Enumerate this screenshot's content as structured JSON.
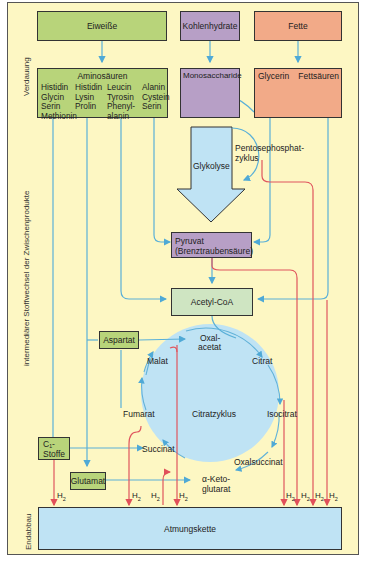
{
  "side_labels": {
    "digestion": "Verdauung",
    "intermediate": "intermediärer Stoffwechsel der Zwischenprodukte",
    "final": "Endabbau"
  },
  "sources": {
    "proteins": "Eiweiße",
    "carbohydrates": "Kohlenhydrate",
    "fats": "Fette"
  },
  "products": {
    "amino_acids_title": "Aminosäuren",
    "amino_acids": [
      [
        "Histidin",
        "Histidin",
        "Leucin",
        "Alanin"
      ],
      [
        "Glycin",
        "Lysin",
        "Tyrosin",
        "Cystein"
      ],
      [
        "Serin",
        "Prolin",
        "Phenyl-",
        "Serin"
      ],
      [
        "Methionin",
        "",
        "alanin",
        ""
      ]
    ],
    "monosaccharides": "Monosaccharide",
    "glycerin": "Glycerin",
    "fatty_acids": "Fettsäuren"
  },
  "pathways": {
    "glycolysis": "Glykolyse",
    "pentose_line1": "Pentosephosphat-",
    "pentose_line2": "zyklus",
    "pyruvate_line1": "Pyruvat",
    "pyruvate_line2": "(Brenztraubensäure)",
    "acetyl_coa": "Acetyl-CoA"
  },
  "side_boxes": {
    "aspartat": "Aspartat",
    "c1_line1": "C₁-",
    "c1_line2": "Stoffe",
    "glutamat": "Glutamat"
  },
  "citric_cycle": {
    "title": "Citratzyklus",
    "oxalacetat_1": "Oxal-",
    "oxalacetat_2": "acetat",
    "citrat": "Citrat",
    "isocitrat": "Isocitrat",
    "oxalsuccinat": "Oxalsuccinat",
    "ketoglutarat_1": "α-Keto-",
    "ketoglutarat_2": "glutarat",
    "succinat": "Succinat",
    "fumarat": "Fumarat",
    "malat": "Malat"
  },
  "hydrogen": {
    "label": "H",
    "sub": "2"
  },
  "final": {
    "respiratory_chain": "Atmungskette"
  },
  "colors": {
    "background": "#fdf7c3",
    "protein_green": "#b8d47a",
    "carb_purple": "#b79fc6",
    "fat_orange": "#f2aa88",
    "acetyl_green": "#cfe5c2",
    "cycle_blue": "#bfe3f4",
    "arrow_blue": "#5ab0d8",
    "hydrogen_red": "#e0555e"
  }
}
